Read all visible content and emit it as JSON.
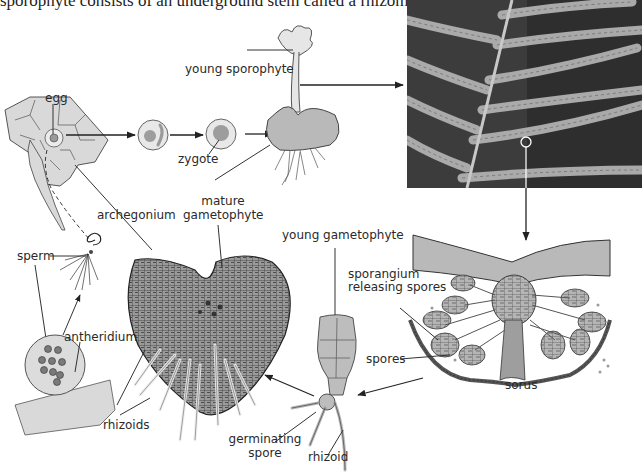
{
  "caption": "sporophyte consists of an underground stem called a rhizome,",
  "figure": {
    "photo": {
      "subject": "fern frond underside with sori",
      "marker": "circle-highlight"
    },
    "labels": {
      "egg": "egg",
      "zygote": "zygote",
      "young_sporophyte": "young sporophyte",
      "mature_gametophyte_1": "mature",
      "mature_gametophyte_2": "gametophyte",
      "archegonium": "archegonium",
      "sperm": "sperm",
      "antheridium": "antheridium",
      "rhizoids": "rhizoids",
      "young_gametophyte": "young gametophyte",
      "sporangium_1": "sporangium",
      "sporangium_2": "releasing spores",
      "spores": "spores",
      "sorus": "sorus",
      "germinating_1": "germinating",
      "germinating_2": "spore",
      "rhizoid": "rhizoid"
    },
    "colors": {
      "cell_fill": "#d9d9d9",
      "tissue_fill": "#bdbdbd",
      "dark_tissue": "#8a8a8a",
      "line": "#333333",
      "photo_bg": "#3a3a3a",
      "pinna": "#a8a8a8"
    }
  }
}
